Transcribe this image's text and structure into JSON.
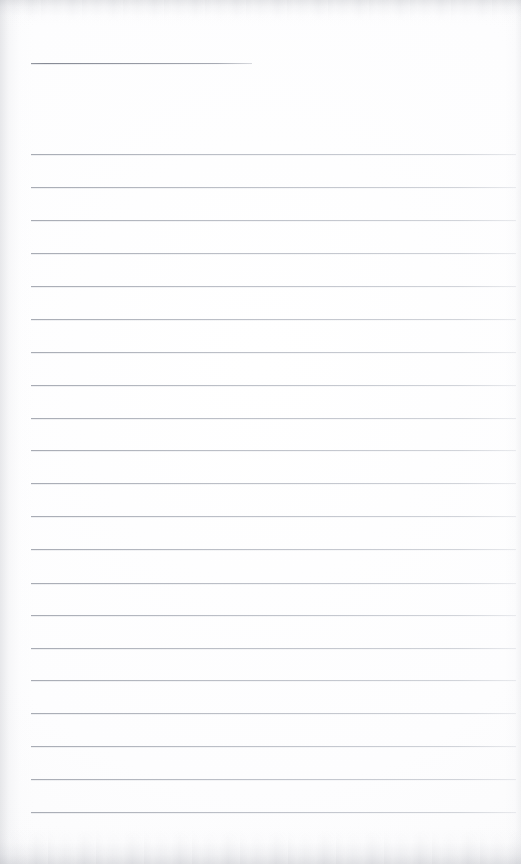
{
  "document": {
    "kind": "scanned-lined-notebook-page",
    "title": "",
    "body_text": "",
    "page_width": 521,
    "page_height": 864,
    "is_blank": "blank"
  },
  "colors": {
    "paper": "#fdfdfd",
    "rule_line": "#b9bdc5",
    "header_rule_line": "#8e929c",
    "scan_edge_shadow": "#b2b4ba"
  },
  "header_rule": {
    "name": "header-rule",
    "y": 63,
    "x_start": 31,
    "x_end": 252,
    "thickness": 1
  },
  "ruling": {
    "name": "horizontal-ruled-lines",
    "count": 21,
    "x_start": 31,
    "x_end": 516,
    "first_y": 154,
    "spacing": 32.9,
    "thickness": 1,
    "lines": [
      {
        "index": 1,
        "y": 154,
        "text": ""
      },
      {
        "index": 2,
        "y": 187,
        "text": ""
      },
      {
        "index": 3,
        "y": 220,
        "text": ""
      },
      {
        "index": 4,
        "y": 253,
        "text": ""
      },
      {
        "index": 5,
        "y": 286,
        "text": ""
      },
      {
        "index": 6,
        "y": 319,
        "text": ""
      },
      {
        "index": 7,
        "y": 352,
        "text": ""
      },
      {
        "index": 8,
        "y": 385,
        "text": ""
      },
      {
        "index": 9,
        "y": 418,
        "text": ""
      },
      {
        "index": 10,
        "y": 450,
        "text": ""
      },
      {
        "index": 11,
        "y": 483,
        "text": ""
      },
      {
        "index": 12,
        "y": 516,
        "text": ""
      },
      {
        "index": 13,
        "y": 549,
        "text": ""
      },
      {
        "index": 14,
        "y": 583,
        "text": ""
      },
      {
        "index": 15,
        "y": 615,
        "text": ""
      },
      {
        "index": 16,
        "y": 648,
        "text": ""
      },
      {
        "index": 17,
        "y": 680,
        "text": ""
      },
      {
        "index": 18,
        "y": 713,
        "text": ""
      },
      {
        "index": 19,
        "y": 746,
        "text": ""
      },
      {
        "index": 20,
        "y": 779,
        "text": ""
      },
      {
        "index": 21,
        "y": 812,
        "text": ""
      }
    ]
  },
  "margins": {
    "top_blank_band": 63,
    "bottom_blank_band": 52,
    "left_blank_band": 31,
    "right_blank_band": 5
  }
}
